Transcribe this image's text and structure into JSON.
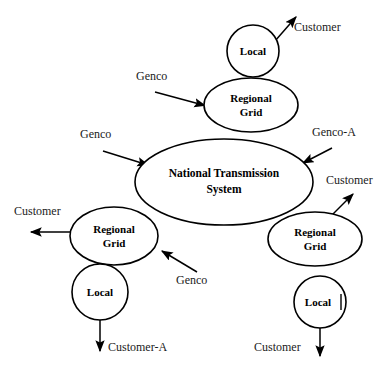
{
  "diagram": {
    "background_color": "#ffffff",
    "stroke_color": "#000000",
    "nodes": [
      {
        "id": "local-top",
        "label_line1": "Local",
        "label_line2": "",
        "shape": "circle",
        "cx": 253,
        "cy": 51,
        "rx": 26,
        "ry": 26
      },
      {
        "id": "regional-grid-top",
        "label_line1": "Regional",
        "label_line2": "Grid",
        "shape": "ellipse",
        "cx": 251,
        "cy": 105,
        "rx": 47,
        "ry": 27
      },
      {
        "id": "national-transmission-system",
        "label_line1": "National Transmission",
        "label_line2": "System",
        "shape": "ellipse",
        "cx": 224,
        "cy": 182,
        "rx": 89,
        "ry": 43
      },
      {
        "id": "regional-grid-left",
        "label_line1": "Regional",
        "label_line2": "Grid",
        "shape": "ellipse",
        "cx": 114,
        "cy": 236,
        "rx": 44,
        "ry": 29
      },
      {
        "id": "local-left",
        "label_line1": "Local",
        "label_line2": "",
        "shape": "circle",
        "cx": 100,
        "cy": 292,
        "rx": 28,
        "ry": 28
      },
      {
        "id": "regional-grid-right",
        "label_line1": "Regional",
        "label_line2": "Grid",
        "shape": "ellipse",
        "cx": 315,
        "cy": 239,
        "rx": 47,
        "ry": 27
      },
      {
        "id": "local-right",
        "label_line1": "Local",
        "label_line2": "",
        "shape": "circle",
        "cx": 320,
        "cy": 302,
        "rx": 28,
        "ry": 25
      }
    ],
    "edges": [
      {
        "id": "local-top-to-customer",
        "label": "Customer",
        "direction": "outgoing",
        "label_x": 294,
        "label_y": 27,
        "x1": 275,
        "y1": 41,
        "x2": 296,
        "y2": 17
      },
      {
        "id": "genco-to-regional-grid-top",
        "label": "Genco",
        "direction": "incoming",
        "label_x": 136,
        "label_y": 76,
        "x1": 155,
        "y1": 92,
        "x2": 207,
        "y2": 106
      },
      {
        "id": "genco-to-national-transmission",
        "label": "Genco",
        "direction": "incoming",
        "label_x": 80,
        "label_y": 134,
        "x1": 103,
        "y1": 151,
        "x2": 150,
        "y2": 166
      },
      {
        "id": "genco-a-to-national-transmission",
        "label": "Genco-A",
        "direction": "incoming",
        "label_x": 313,
        "label_y": 132,
        "x1": 332,
        "y1": 148,
        "x2": 302,
        "y2": 163
      },
      {
        "id": "regional-grid-left-to-customer",
        "label": "Customer",
        "direction": "outgoing",
        "label_x": 14,
        "label_y": 211,
        "x1": 71,
        "y1": 232,
        "x2": 30,
        "y2": 232
      },
      {
        "id": "genco-to-regional-grid-left",
        "label": "Genco",
        "direction": "incoming",
        "label_x": 176,
        "label_y": 280,
        "x1": 197,
        "y1": 272,
        "x2": 161,
        "y2": 250
      },
      {
        "id": "local-left-to-customer-a",
        "label": "Customer-A",
        "direction": "outgoing",
        "label_x": 107,
        "label_y": 347,
        "x1": 100,
        "y1": 318,
        "x2": 100,
        "y2": 352
      },
      {
        "id": "regional-grid-right-to-customer",
        "label": "Customer",
        "direction": "outgoing",
        "label_x": 327,
        "label_y": 180,
        "x1": 331,
        "y1": 216,
        "x2": 353,
        "y2": 194
      },
      {
        "id": "local-right-to-customer",
        "label": "Customer",
        "direction": "outgoing",
        "label_x": 255,
        "label_y": 347,
        "x1": 320,
        "y1": 327,
        "x2": 320,
        "y2": 357
      }
    ]
  }
}
